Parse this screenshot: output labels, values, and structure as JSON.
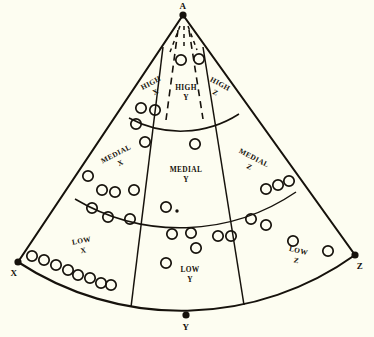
{
  "figure": {
    "background_color": "#fdfdf1",
    "ink_color": "#16120c",
    "apex_label": "A",
    "vertices": [
      {
        "name": "apex",
        "label": "A",
        "x": 183,
        "y": 15
      },
      {
        "name": "left-corner",
        "label": "X",
        "x": 18,
        "y": 262
      },
      {
        "name": "bottom",
        "label": "Y",
        "x": 186,
        "y": 315
      },
      {
        "name": "right-corner",
        "label": "Z",
        "x": 355,
        "y": 255
      }
    ],
    "zones": [
      {
        "id": "high-x",
        "label_line1": "HIGH",
        "label_line2": "X",
        "x": 152,
        "y": 85,
        "rotation": -28
      },
      {
        "id": "high-y",
        "label_line1": "HIGH",
        "label_line2": "Y",
        "x": 186,
        "y": 90,
        "rotation": 0
      },
      {
        "id": "high-z",
        "label_line1": "HIGH",
        "label_line2": "Z",
        "x": 219,
        "y": 86,
        "rotation": 28
      },
      {
        "id": "medial-x",
        "label_line1": "MEDIAL",
        "label_line2": "X",
        "x": 117,
        "y": 156,
        "rotation": -27
      },
      {
        "id": "medial-y",
        "label_line1": "MEDIAL",
        "label_line2": "Y",
        "x": 186,
        "y": 172,
        "rotation": 0
      },
      {
        "id": "medial-z",
        "label_line1": "MEDIAL",
        "label_line2": "Z",
        "x": 253,
        "y": 160,
        "rotation": 27
      },
      {
        "id": "low-x",
        "label_line1": "LOW",
        "label_line2": "X",
        "x": 82,
        "y": 243,
        "rotation": -11
      },
      {
        "id": "low-y",
        "label_line1": "LOW",
        "label_line2": "Y",
        "x": 190,
        "y": 272,
        "rotation": 0
      },
      {
        "id": "low-z",
        "label_line1": "LOW",
        "label_line2": "Z",
        "x": 298,
        "y": 253,
        "rotation": 13
      }
    ],
    "markers": {
      "radius": 5.2,
      "high_y": [
        {
          "x": 181,
          "y": 60
        },
        {
          "x": 199,
          "y": 59
        }
      ],
      "high_x": [
        {
          "x": 141,
          "y": 108
        },
        {
          "x": 155,
          "y": 110
        }
      ],
      "medial_x": [
        {
          "x": 136,
          "y": 124
        },
        {
          "x": 145,
          "y": 142
        },
        {
          "x": 88,
          "y": 176
        },
        {
          "x": 102,
          "y": 190
        },
        {
          "x": 115,
          "y": 192
        },
        {
          "x": 134,
          "y": 190
        }
      ],
      "medial_y": [
        {
          "x": 195,
          "y": 144
        },
        {
          "x": 166,
          "y": 207
        }
      ],
      "medial_z": [
        {
          "x": 266,
          "y": 189
        },
        {
          "x": 278,
          "y": 185
        },
        {
          "x": 289,
          "y": 181
        }
      ],
      "low_x": [
        {
          "x": 92,
          "y": 208
        },
        {
          "x": 108,
          "y": 217
        },
        {
          "x": 130,
          "y": 219
        },
        {
          "x": 32,
          "y": 256
        },
        {
          "x": 44,
          "y": 260
        },
        {
          "x": 56,
          "y": 265
        },
        {
          "x": 68,
          "y": 270
        },
        {
          "x": 78,
          "y": 275
        },
        {
          "x": 90,
          "y": 278
        },
        {
          "x": 101,
          "y": 283
        },
        {
          "x": 111,
          "y": 285
        }
      ],
      "low_y": [
        {
          "x": 172,
          "y": 234
        },
        {
          "x": 191,
          "y": 233
        },
        {
          "x": 196,
          "y": 248
        },
        {
          "x": 166,
          "y": 263
        },
        {
          "x": 218,
          "y": 236
        },
        {
          "x": 231,
          "y": 236
        }
      ],
      "low_z": [
        {
          "x": 251,
          "y": 219
        },
        {
          "x": 266,
          "y": 225
        },
        {
          "x": 293,
          "y": 241
        },
        {
          "x": 328,
          "y": 251
        }
      ],
      "small_dots": [
        {
          "x": 177,
          "y": 211,
          "r": 1.7
        }
      ]
    }
  }
}
